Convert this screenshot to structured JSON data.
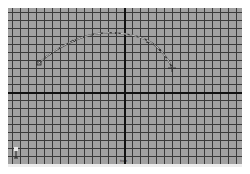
{
  "viewport": {
    "view_label": "front",
    "background_color": "#a2a2a2",
    "grid_color": "#3a3a3a",
    "axis_color": "#111111",
    "grid_spacing_px": 8
  },
  "axis_indicator": {
    "icon": "axis-gizmo-icon",
    "y_label": "y",
    "x_label": "x"
  },
  "curve": {
    "type": "ep-curve",
    "color": "#f0f0f0",
    "shadow_color": "#3a3a3a",
    "points": [
      [
        39,
        63
      ],
      [
        66,
        42
      ],
      [
        100,
        31
      ],
      [
        132,
        33
      ],
      [
        156,
        47
      ],
      [
        172,
        68
      ]
    ],
    "start_marker": [
      39,
      63
    ],
    "end_marker": [
      172,
      68
    ]
  }
}
